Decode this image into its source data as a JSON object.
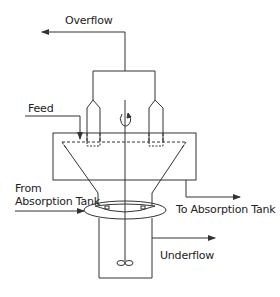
{
  "diagram": {
    "labels": {
      "overflow": "Overflow",
      "feed": "Feed",
      "to_absorption_tank": "To Absorption Tank",
      "from_absorption_line1": "From",
      "from_absorption_line2": "Absorption Tank",
      "underflow": "Underflow"
    },
    "colors": {
      "stroke": "#333333",
      "background": "#ffffff"
    }
  }
}
